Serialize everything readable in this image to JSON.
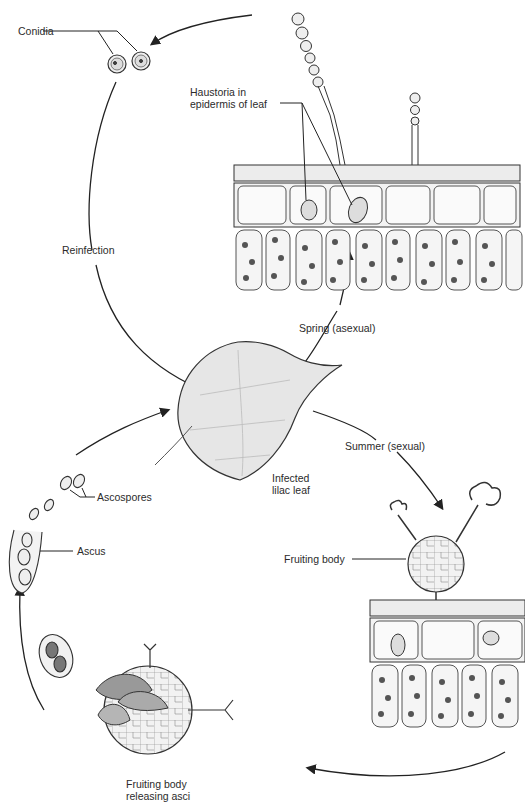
{
  "labels": {
    "conidia": "Conidia",
    "haustoria_line1": "Haustoria in",
    "haustoria_line2": "epidermis of leaf",
    "reinfection": "Reinfection",
    "spring": "Spring (asexual)",
    "summer": "Summer (sexual)",
    "leaf_line1": "Infected",
    "leaf_line2": "lilac leaf",
    "ascospores": "Ascospores",
    "ascus": "Ascus",
    "fruiting_body": "Fruiting body",
    "releasing_line1": "Fruiting body",
    "releasing_line2": "releasing asci"
  },
  "cycle_stages": [
    {
      "stage": "Infected lilac leaf",
      "next": "Spring (asexual)"
    },
    {
      "stage": "Spring (asexual)",
      "next": "Conidia"
    },
    {
      "stage": "Conidia",
      "next": "Reinfection"
    },
    {
      "stage": "Summer (sexual)",
      "next": "Fruiting body"
    },
    {
      "stage": "Fruiting body",
      "next": "Fruiting body releasing asci"
    },
    {
      "stage": "Fruiting body releasing asci",
      "next": "Ascus"
    },
    {
      "stage": "Ascus",
      "next": "Ascospores"
    },
    {
      "stage": "Ascospores",
      "next": "Infected lilac leaf"
    }
  ],
  "colors": {
    "line": "#222222",
    "fill": "#e9e9e9",
    "cell": "#cfcfcf",
    "chloroplast": "#555555"
  }
}
